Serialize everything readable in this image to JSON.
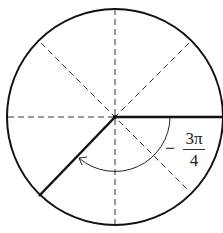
{
  "diagram": {
    "type": "unit-circle-angle",
    "angle_label": {
      "sign": "−",
      "numerator": "3π",
      "denominator": "4"
    },
    "colors": {
      "stroke": "#111111",
      "dashed": "#333333",
      "background": "#ffffff"
    }
  }
}
